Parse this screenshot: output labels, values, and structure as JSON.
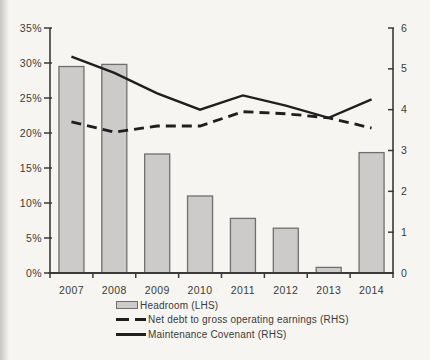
{
  "colors": {
    "background": "#f6f5f2",
    "bar_fill": "#cccbca",
    "bar_border": "#6f6f6f",
    "line": "#1f1f1f",
    "axis": "#3a3a3a",
    "text": "#3a3a3a"
  },
  "legend": {
    "items": [
      {
        "label": "Headroom (LHS)",
        "swatch": "bar"
      },
      {
        "label": "Net debt to gross operating earnings (RHS)",
        "swatch": "dashed-line"
      },
      {
        "label": "Maintenance Covenant (RHS)",
        "swatch": "solid-line"
      }
    ]
  },
  "chart_data": {
    "type": "bar+line combo",
    "categories": [
      "2007",
      "2008",
      "2009",
      "2010",
      "2011",
      "2012",
      "2013",
      "2014"
    ],
    "series": [
      {
        "name": "Headroom (LHS)",
        "type": "bar",
        "axis": "left",
        "values": [
          29.5,
          29.8,
          17.0,
          11.0,
          7.8,
          6.4,
          0.8,
          17.2
        ]
      },
      {
        "name": "Net debt to gross operating earnings (RHS)",
        "type": "line",
        "style": "dashed",
        "axis": "right",
        "values": [
          3.7,
          3.45,
          3.6,
          3.6,
          3.95,
          3.9,
          3.8,
          3.55
        ]
      },
      {
        "name": "Maintenance Covenant (RHS)",
        "type": "line",
        "style": "solid",
        "axis": "right",
        "values": [
          5.3,
          4.9,
          4.4,
          4.0,
          4.35,
          4.1,
          3.8,
          4.25
        ]
      }
    ],
    "left_axis": {
      "min": 0,
      "max": 35,
      "step": 5,
      "unit": "%",
      "tick_labels": [
        "0%",
        "5%",
        "10%",
        "15%",
        "20%",
        "25%",
        "30%",
        "35%"
      ]
    },
    "right_axis": {
      "min": 0,
      "max": 6,
      "step": 1,
      "tick_labels": [
        "0",
        "1",
        "2",
        "3",
        "4",
        "5",
        "6"
      ]
    },
    "grid": false,
    "title": "",
    "legend_position": "bottom-left"
  }
}
